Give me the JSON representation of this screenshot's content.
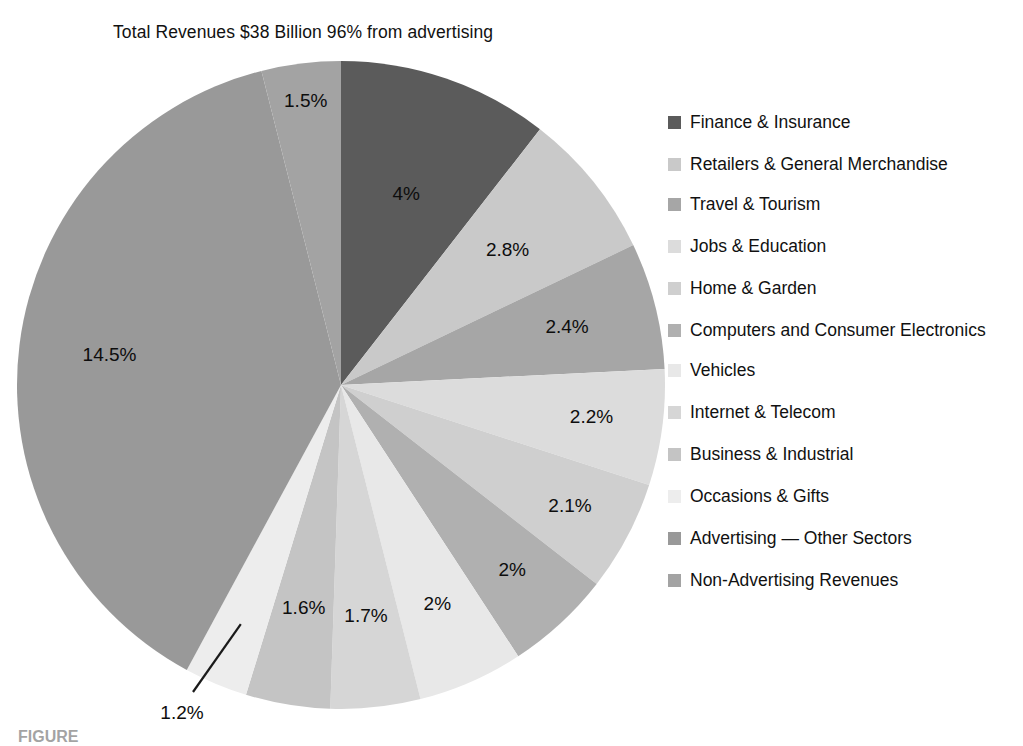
{
  "chart_data": {
    "type": "pie",
    "title": "Total Revenues $38 Billion 96% from advertising",
    "start_angle_deg": 0,
    "direction": "clockwise",
    "center": {
      "x": 341,
      "y": 385
    },
    "radius": 324,
    "categories": [
      "Finance & Insurance",
      "Retailers & General Merchandise",
      "Travel & Tourism",
      "Jobs & Education",
      "Home & Garden",
      "Computers and Consumer Electronics",
      "Vehicles",
      "Internet & Telecom",
      "Business & Industrial",
      "Occasions & Gifts",
      "Advertising — Other Sectors",
      "Non-Advertising Revenues"
    ],
    "values": [
      4,
      2.8,
      2.4,
      2.2,
      2.1,
      2,
      2,
      1.7,
      1.6,
      1.2,
      14.5,
      1.5
    ],
    "value_labels": [
      "4%",
      "2.8%",
      "2.4%",
      "2.2%",
      "2.1%",
      "2%",
      "2%",
      "1.7%",
      "1.6%",
      "1.2%",
      "14.5%",
      "1.5%"
    ],
    "colors": [
      "#5b5b5b",
      "#c9c9c9",
      "#a6a6a6",
      "#dcdcdc",
      "#cfcfcf",
      "#b0b0b0",
      "#e8e8e8",
      "#d6d6d6",
      "#c4c4c4",
      "#ededed",
      "#999999",
      "#a3a3a3"
    ],
    "leader_line_label": "1.2%",
    "legend_position": "right",
    "grid": false,
    "xlabel": "",
    "ylabel": ""
  },
  "legend": {
    "items": [
      {
        "label": "Finance & Insurance",
        "color": "#5b5b5b"
      },
      {
        "label": "Retailers & General Merchandise",
        "color": "#c9c9c9"
      },
      {
        "label": "Travel & Tourism",
        "color": "#a6a6a6"
      },
      {
        "label": "Jobs & Education",
        "color": "#dcdcdc"
      },
      {
        "label": "Home & Garden",
        "color": "#cfcfcf"
      },
      {
        "label": "Computers and Consumer Electronics",
        "color": "#b0b0b0"
      },
      {
        "label": "Vehicles",
        "color": "#e8e8e8"
      },
      {
        "label": "Internet & Telecom",
        "color": "#d6d6d6"
      },
      {
        "label": "Business & Industrial",
        "color": "#c4c4c4"
      },
      {
        "label": "Occasions & Gifts",
        "color": "#ededed"
      },
      {
        "label": "Advertising — Other Sectors",
        "color": "#999999"
      },
      {
        "label": "Non-Advertising Revenues",
        "color": "#a3a3a3"
      }
    ]
  },
  "caption": {
    "text": "FIGURE"
  }
}
